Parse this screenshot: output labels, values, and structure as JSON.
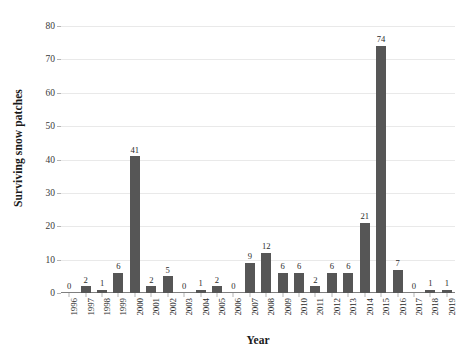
{
  "chart_data": {
    "type": "bar",
    "title": "",
    "subtitle": "",
    "xlabel": "Year",
    "ylabel": "Surviving snow patches",
    "categories": [
      "1996",
      "1997",
      "1998",
      "1999",
      "2000",
      "2001",
      "2002",
      "2003",
      "2004",
      "2005",
      "2006",
      "2007",
      "2008",
      "2009",
      "2010",
      "2011",
      "2012",
      "2013",
      "2014",
      "2015",
      "2016",
      "2017",
      "2018",
      "2019"
    ],
    "values": [
      0,
      2,
      1,
      6,
      41,
      2,
      5,
      0,
      1,
      2,
      0,
      9,
      12,
      6,
      6,
      2,
      6,
      6,
      21,
      74,
      7,
      0,
      1,
      1
    ],
    "data_labels": [
      "0",
      "2",
      "1",
      "6",
      "41",
      "2",
      "5",
      "0",
      "1",
      "2",
      "0",
      "9",
      "12",
      "6",
      "6",
      "2",
      "6",
      "6",
      "21",
      "74",
      "7",
      "0",
      "1",
      "1"
    ],
    "ylim": [
      0,
      80
    ],
    "ytick_values": [
      0,
      10,
      20,
      30,
      40,
      50,
      60,
      70,
      80
    ],
    "ytick_labels": [
      "0",
      "10",
      "20",
      "30",
      "40",
      "50",
      "60",
      "70",
      "80"
    ],
    "grid": "horizontal",
    "legend": "none",
    "show_data_labels": true,
    "xtick_rotation": -90,
    "colors": {
      "bar": "#565656",
      "gridline": "#e9e9e9",
      "axis": "#7f7f7f",
      "tick_mark": "#b5b5b5",
      "text": "#2b2b2b",
      "background": "#ffffff"
    }
  }
}
